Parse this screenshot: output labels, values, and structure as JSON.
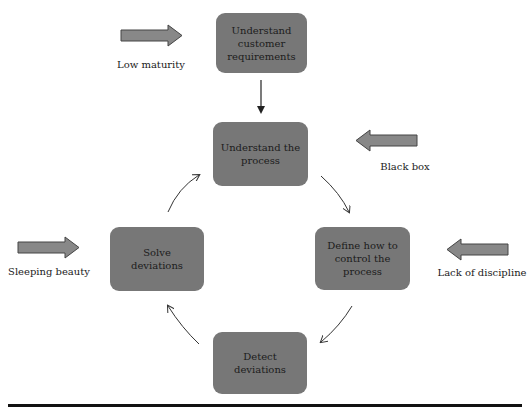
{
  "diagram": {
    "type": "process-cycle",
    "boxes": [
      {
        "id": "customer",
        "label": "Understand customer requirements"
      },
      {
        "id": "process",
        "label": "Understand the process"
      },
      {
        "id": "control",
        "label": "Define how to control the process"
      },
      {
        "id": "detect",
        "label": "Detect deviations"
      },
      {
        "id": "solve",
        "label": "Solve deviations"
      }
    ],
    "flow": [
      {
        "from": "customer",
        "to": "process",
        "style": "straight"
      },
      {
        "from": "process",
        "to": "control",
        "style": "curved"
      },
      {
        "from": "control",
        "to": "detect",
        "style": "curved"
      },
      {
        "from": "detect",
        "to": "solve",
        "style": "curved"
      },
      {
        "from": "solve",
        "to": "process",
        "style": "curved"
      }
    ],
    "pitfalls": [
      {
        "label": "Low maturity",
        "target": "customer",
        "direction": "right"
      },
      {
        "label": "Black box",
        "target": "process",
        "direction": "left"
      },
      {
        "label": "Sleeping beauty",
        "target": "solve",
        "direction": "right"
      },
      {
        "label": "Lack of discipline",
        "target": "control",
        "direction": "left"
      }
    ],
    "colors": {
      "box_fill": "#777777",
      "pitfall_arrow_fill": "#888888",
      "pitfall_arrow_stroke": "#444444",
      "connector": "#333333",
      "rule": "#111111"
    }
  }
}
